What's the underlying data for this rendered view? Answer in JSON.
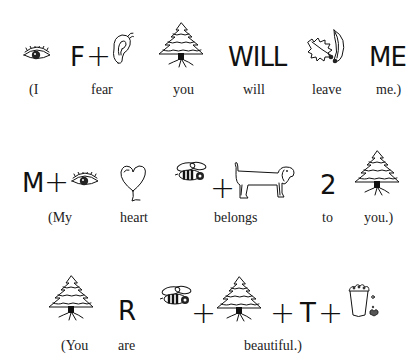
{
  "puzzle": {
    "rows": [
      {
        "symbols": [
          {
            "type": "icon",
            "icon": "eye-icon"
          },
          {
            "type": "text",
            "text": "F"
          },
          {
            "type": "plus",
            "text": "+"
          },
          {
            "type": "icon",
            "icon": "ear-icon"
          },
          {
            "type": "icon",
            "icon": "tree-icon"
          },
          {
            "type": "text",
            "text": "WILL"
          },
          {
            "type": "icon",
            "icon": "holly-leaf-icon"
          },
          {
            "type": "text",
            "text": "ME"
          }
        ],
        "captions": [
          "(I",
          "fear",
          "you",
          "will",
          "leave",
          "me.)"
        ]
      },
      {
        "symbols": [
          {
            "type": "text",
            "text": "M"
          },
          {
            "type": "plus",
            "text": "+"
          },
          {
            "type": "icon",
            "icon": "eye-icon"
          },
          {
            "type": "icon",
            "icon": "heart-icon"
          },
          {
            "type": "icon",
            "icon": "bee-icon"
          },
          {
            "type": "plus",
            "text": "+"
          },
          {
            "type": "icon",
            "icon": "long-dog-icon"
          },
          {
            "type": "text",
            "text": "2"
          },
          {
            "type": "icon",
            "icon": "tree-icon"
          }
        ],
        "captions": [
          "(My",
          "heart",
          "belongs",
          "to",
          "you.)"
        ]
      },
      {
        "symbols": [
          {
            "type": "icon",
            "icon": "tree-icon"
          },
          {
            "type": "text",
            "text": "R"
          },
          {
            "type": "icon",
            "icon": "bee-icon"
          },
          {
            "type": "plus",
            "text": "+"
          },
          {
            "type": "icon",
            "icon": "tree-icon"
          },
          {
            "type": "plus",
            "text": "+"
          },
          {
            "type": "text",
            "text": "T"
          },
          {
            "type": "plus",
            "text": "+"
          },
          {
            "type": "icon",
            "icon": "popcorn-bucket-icon"
          }
        ],
        "captions": [
          "(You",
          "are",
          "beautiful.)"
        ]
      }
    ]
  }
}
